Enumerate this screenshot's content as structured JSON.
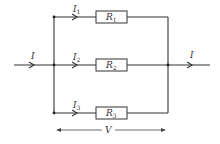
{
  "diagram": {
    "type": "parallel-circuit",
    "input_current": {
      "label": "I"
    },
    "output_current": {
      "label": "I"
    },
    "branches": [
      {
        "current": {
          "label": "I",
          "sub": "1"
        },
        "resistor": {
          "label": "R",
          "sub": "1"
        }
      },
      {
        "current": {
          "label": "I",
          "sub": "2"
        },
        "resistor": {
          "label": "R",
          "sub": "2"
        }
      },
      {
        "current": {
          "label": "I",
          "sub": "3"
        },
        "resistor": {
          "label": "R",
          "sub": "3"
        }
      }
    ],
    "voltage": {
      "label": "V"
    },
    "colors": {
      "line": "#333333",
      "background": "#ffffff"
    }
  }
}
